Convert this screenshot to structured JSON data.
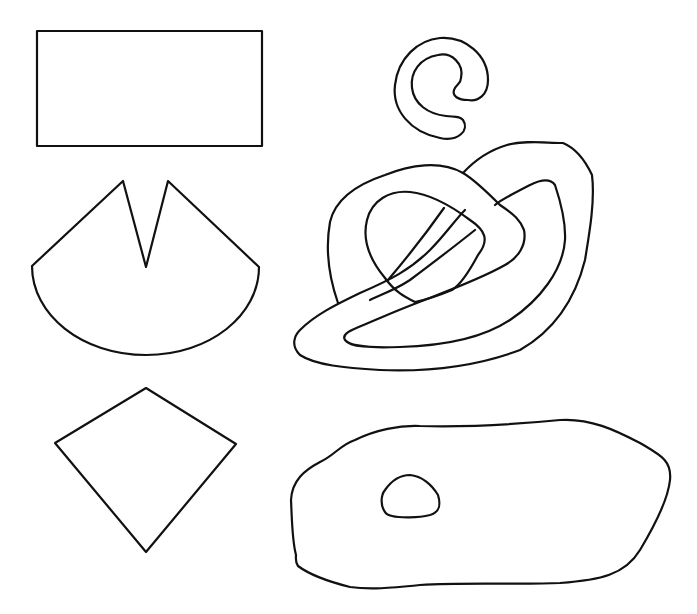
{
  "figure": {
    "stroke_color": "#111111",
    "background_color": "#ffffff",
    "shapes": [
      {
        "id": "rectangle",
        "label": "rectangle",
        "column": "left",
        "row": 1
      },
      {
        "id": "notched-sector",
        "label": "circular sector with V notch",
        "column": "left",
        "row": 2
      },
      {
        "id": "kite",
        "label": "kite / quadrilateral",
        "column": "left",
        "row": 3
      },
      {
        "id": "spiral-blob",
        "label": "curled spiral shape",
        "column": "right",
        "row": 1
      },
      {
        "id": "knot",
        "label": "interlaced knot-like closed curve",
        "column": "right",
        "row": 2
      },
      {
        "id": "blob-with-hole",
        "label": "irregular blob with small inner hole",
        "column": "right",
        "row": 3
      }
    ]
  }
}
